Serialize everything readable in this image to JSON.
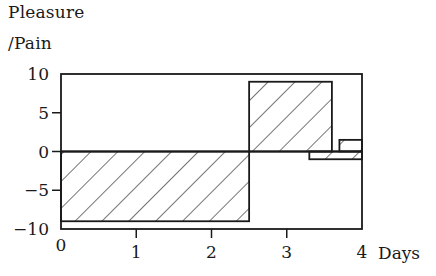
{
  "chart_data": {
    "type": "bar",
    "title": "",
    "ylabel_line1": "Pleasure",
    "ylabel_line2": "/Pain",
    "xlabel": "Days",
    "xlim": [
      0,
      4
    ],
    "ylim": [
      -10,
      10
    ],
    "xticks": [
      0,
      1,
      2,
      3,
      4
    ],
    "yticks": [
      10,
      5,
      0,
      -5,
      -10
    ],
    "xtick_labels": [
      "0",
      "1",
      "2",
      "3",
      "4"
    ],
    "ytick_labels": [
      "10",
      "5",
      "0",
      "-5",
      "-10"
    ],
    "grid": false,
    "legend": null,
    "bars": [
      {
        "name": "pain-period-1",
        "x_start": 0,
        "x_end": 2.5,
        "value": -9,
        "hatched": true
      },
      {
        "name": "pleasure-period-1",
        "x_start": 2.5,
        "x_end": 3.6,
        "value": 9,
        "hatched": true
      },
      {
        "name": "pain-period-2",
        "x_start": 3.3,
        "x_end": 4.0,
        "value": -1,
        "hatched": true
      },
      {
        "name": "pleasure-period-2",
        "x_start": 3.7,
        "x_end": 4.0,
        "value": 1.5,
        "hatched": true
      }
    ]
  },
  "labels": {
    "y_line1": "Pleasure",
    "y_line2": "/Pain",
    "x_axis": "Days"
  }
}
